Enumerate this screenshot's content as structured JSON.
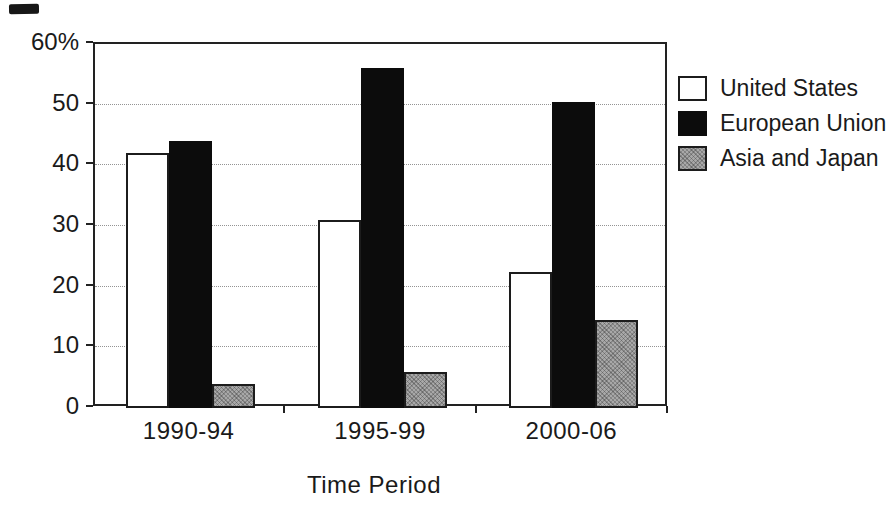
{
  "chart_data": {
    "type": "bar",
    "title": "",
    "categories": [
      "1990-94",
      "1995-99",
      "2000-06"
    ],
    "series": [
      {
        "name": "United States",
        "values": [
          42,
          31,
          22.5
        ],
        "fill": "#ffffff",
        "pattern": "none"
      },
      {
        "name": "European Union",
        "values": [
          44,
          56,
          50.5
        ],
        "fill": "#0c0c0c",
        "pattern": "none"
      },
      {
        "name": "Asia and Japan",
        "values": [
          4,
          6,
          14.5
        ],
        "fill": "#a8a8a8",
        "pattern": "speckle"
      }
    ],
    "xlabel": "Time Period",
    "ylabel": "",
    "ylim": [
      0,
      60
    ],
    "ytick_step": 10,
    "ytick_labels": [
      "0",
      "10",
      "20",
      "30",
      "40",
      "50",
      "60%"
    ],
    "grid": "horizontal-dotted",
    "legend_position": "right",
    "colors": {
      "frame": "#222222",
      "gridline": "#949494",
      "bar_border": "#1c1c1c",
      "text": "#1a1a1a"
    }
  }
}
